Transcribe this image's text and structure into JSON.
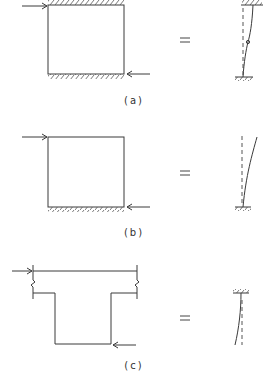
{
  "figure": {
    "panels": [
      {
        "id": "a",
        "label": "(a)",
        "left_shape": "rectangular panel fixed at top and bottom",
        "equals": "=",
        "right_shape": "column fixed at both ends with inflection point",
        "loads": [
          "horizontal force at top-left pointing right",
          "horizontal force at bottom-right pointing left"
        ]
      },
      {
        "id": "b",
        "label": "(b)",
        "left_shape": "rectangular panel fixed at bottom",
        "equals": "=",
        "right_shape": "cantilever column fixed at base",
        "loads": [
          "horizontal force at top-left pointing right",
          "horizontal force at bottom-right pointing left"
        ]
      },
      {
        "id": "c",
        "label": "(c)",
        "left_shape": "T-shaped section with broken flange",
        "equals": "=",
        "right_shape": "cantilever column fixed at top",
        "loads": [
          "horizontal force at top-left pointing right",
          "horizontal force at bottom-right pointing left"
        ]
      }
    ]
  },
  "colors": {
    "line": "#3a3a3a",
    "background": "#ffffff"
  }
}
